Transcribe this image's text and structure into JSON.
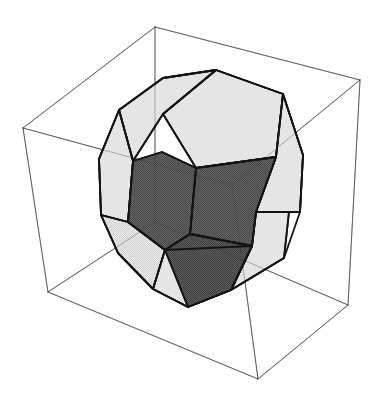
{
  "figure": {
    "canvas": {
      "width": 383,
      "height": 405,
      "background": "#ffffff"
    }
  },
  "style": {
    "background_color": "#ffffff",
    "face_light_color": "#e6e6e6",
    "face_mid_color": "#dedede",
    "face_dark_color": "#575757",
    "face_dark_alt_color": "#4f4f4f",
    "solid_edge_color": "#141414",
    "solid_edge_width": 1.8,
    "box_edge_color": "#3a3a3a",
    "box_edge_width": 0.7
  },
  "bounding_box": {
    "name": "wireframe-cuboid",
    "edge_color": "#3a3a3a",
    "edge_width": 0.7,
    "vertices": {
      "top_back": [
        155,
        27
      ],
      "top_right": [
        360,
        80
      ],
      "top_left": [
        23,
        128
      ],
      "top_front": [
        232,
        185
      ],
      "bottom_back": [
        155,
        222
      ],
      "bottom_right": [
        348,
        305
      ],
      "bottom_left": [
        48,
        292
      ],
      "bottom_front": [
        258,
        379
      ]
    },
    "edges": [
      [
        "top_back",
        "top_right"
      ],
      [
        "top_back",
        "top_left"
      ],
      [
        "top_left",
        "top_front"
      ],
      [
        "top_right",
        "top_front"
      ],
      [
        "top_left",
        "bottom_left"
      ],
      [
        "top_right",
        "bottom_right"
      ],
      [
        "top_front",
        "bottom_front"
      ],
      [
        "top_back",
        "bottom_back"
      ],
      [
        "bottom_left",
        "bottom_front"
      ],
      [
        "bottom_right",
        "bottom_front"
      ],
      [
        "bottom_back",
        "bottom_left"
      ],
      [
        "bottom_back",
        "bottom_right"
      ]
    ]
  },
  "solid": {
    "name": "dodecahedron",
    "face_count": 12,
    "visible_face_count": 9,
    "vertex_count": 20,
    "silhouette": [
      [
        216,
        70
      ],
      [
        283,
        94
      ],
      [
        303,
        155
      ],
      [
        300,
        212
      ],
      [
        284,
        258
      ],
      [
        231,
        290
      ],
      [
        188,
        307
      ],
      [
        153,
        289
      ],
      [
        118,
        253
      ],
      [
        101,
        215
      ],
      [
        99,
        159
      ],
      [
        119,
        110
      ],
      [
        163,
        78
      ]
    ],
    "faces": [
      {
        "id": "face-top",
        "shade": "light",
        "fill": "#e6e6e6",
        "points": [
          [
            216,
            70
          ],
          [
            283,
            94
          ],
          [
            276,
            157
          ],
          [
            196,
            168
          ],
          [
            163,
            114
          ]
        ]
      },
      {
        "id": "face-upper-left",
        "shade": "light",
        "fill": "#e6e6e6",
        "points": [
          [
            216,
            70
          ],
          [
            163,
            78
          ],
          [
            119,
            110
          ],
          [
            133,
            161
          ],
          [
            163,
            114
          ]
        ]
      },
      {
        "id": "face-left-upper",
        "shade": "light",
        "fill": "#e2e2e2",
        "points": [
          [
            119,
            110
          ],
          [
            99,
            159
          ],
          [
            101,
            215
          ],
          [
            128,
            222
          ],
          [
            133,
            161
          ]
        ]
      },
      {
        "id": "face-left-lower",
        "shade": "light",
        "fill": "#dedede",
        "points": [
          [
            101,
            215
          ],
          [
            118,
            253
          ],
          [
            153,
            289
          ],
          [
            165,
            250
          ],
          [
            128,
            222
          ]
        ]
      },
      {
        "id": "face-bottom",
        "shade": "light",
        "fill": "#e2e2e2",
        "points": [
          [
            153,
            289
          ],
          [
            188,
            307
          ],
          [
            231,
            290
          ],
          [
            252,
            246
          ],
          [
            165,
            250
          ]
        ]
      },
      {
        "id": "face-right-lower",
        "shade": "light",
        "fill": "#e6e6e6",
        "points": [
          [
            231,
            290
          ],
          [
            284,
            258
          ],
          [
            289,
            212
          ],
          [
            256,
            212
          ],
          [
            252,
            246
          ]
        ]
      },
      {
        "id": "face-right-upper",
        "shade": "light",
        "fill": "#e6e6e6",
        "points": [
          [
            283,
            94
          ],
          [
            303,
            155
          ],
          [
            300,
            212
          ],
          [
            256,
            212
          ],
          [
            276,
            157
          ]
        ]
      },
      {
        "id": "face-front-center",
        "shade": "dark",
        "fill": "#575757",
        "points": [
          [
            196,
            168
          ],
          [
            276,
            157
          ],
          [
            256,
            212
          ],
          [
            252,
            246
          ],
          [
            190,
            234
          ]
        ]
      },
      {
        "id": "face-front-left",
        "shade": "dark",
        "fill": "#575757",
        "points": [
          [
            196,
            168
          ],
          [
            190,
            234
          ],
          [
            165,
            250
          ],
          [
            128,
            222
          ],
          [
            133,
            161
          ],
          [
            162,
            152
          ]
        ]
      },
      {
        "id": "face-front-bottom",
        "shade": "dark",
        "fill": "#4f4f4f",
        "points": [
          [
            190,
            234
          ],
          [
            252,
            246
          ],
          [
            231,
            290
          ],
          [
            188,
            307
          ],
          [
            165,
            250
          ]
        ]
      }
    ],
    "edges_note": "All visible polygon boundaries are stroked in near-black; hidden edges are not drawn."
  }
}
